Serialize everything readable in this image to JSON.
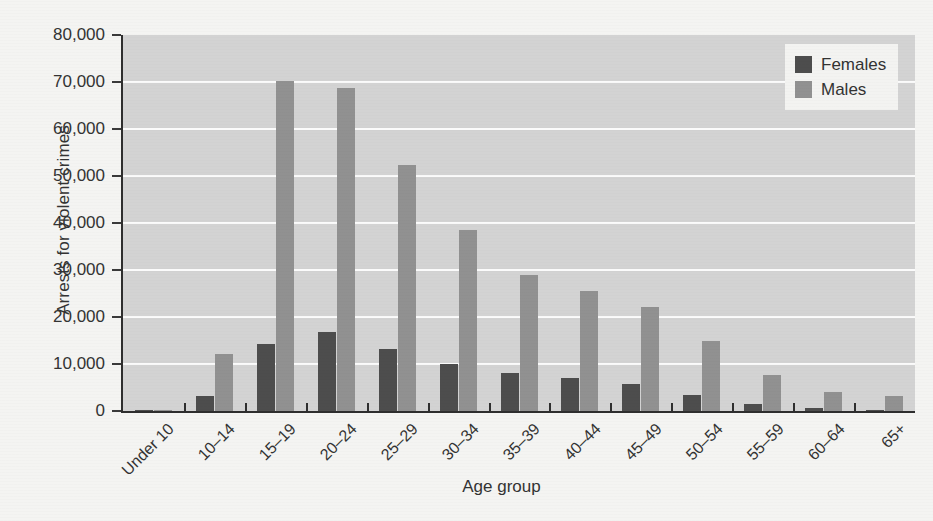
{
  "chart_data": {
    "type": "bar",
    "title": "",
    "xlabel": "Age group",
    "ylabel": "Arrests for violent crimes",
    "categories": [
      "Under 10",
      "10–14",
      "15–19",
      "20–24",
      "25–29",
      "30–34",
      "35–39",
      "40–44",
      "45–49",
      "50–54",
      "55–59",
      "60–64",
      "65+"
    ],
    "series": [
      {
        "name": "Females",
        "color": "#4d4d4d",
        "values": [
          200,
          3300,
          14200,
          16800,
          13200,
          10000,
          8100,
          7000,
          5800,
          3400,
          1500,
          600,
          300
        ]
      },
      {
        "name": "Males",
        "color": "#919191",
        "values": [
          300,
          12200,
          70200,
          68800,
          52400,
          38500,
          29000,
          25500,
          22200,
          14800,
          7600,
          4000,
          3100
        ]
      }
    ],
    "ylim": [
      0,
      80000
    ],
    "yticks": [
      0,
      10000,
      20000,
      30000,
      40000,
      50000,
      60000,
      70000,
      80000
    ],
    "ytick_labels": [
      "0",
      "10,000",
      "20,000",
      "30,000",
      "40,000",
      "50,000",
      "60,000",
      "70,000",
      "80,000"
    ],
    "grid": "horizontal",
    "legend_position": "top-right",
    "plot_background": "#d3d3d3",
    "gridline_color": "#fbfbfb",
    "axis_color": "#2e2e2e"
  }
}
